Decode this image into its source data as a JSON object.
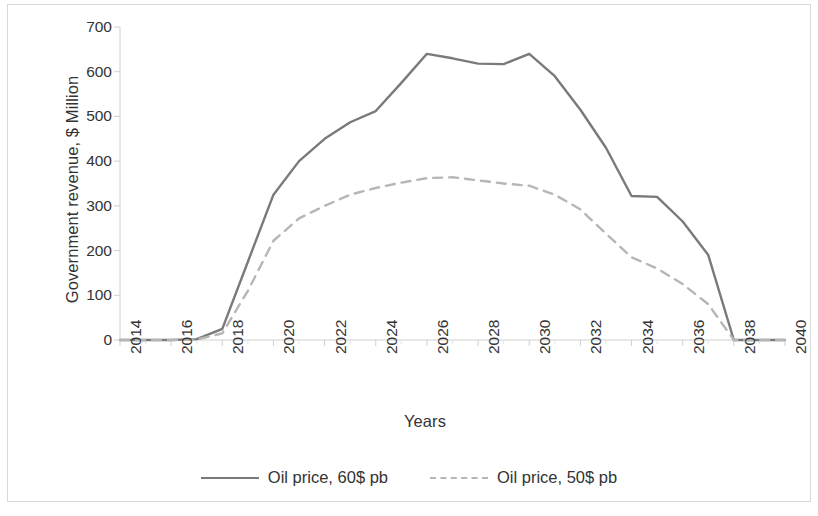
{
  "chart_data": {
    "type": "line",
    "title": "",
    "xlabel": "Years",
    "ylabel": "Government revenue, $ Million",
    "xlim": [
      2014,
      2040
    ],
    "ylim": [
      0,
      700
    ],
    "ytick_step": 100,
    "yticks": [
      0,
      100,
      200,
      300,
      400,
      500,
      600,
      700
    ],
    "xticks": [
      2014,
      2016,
      2018,
      2020,
      2022,
      2024,
      2026,
      2028,
      2030,
      2032,
      2034,
      2036,
      2038,
      2040
    ],
    "xtick_rotation": -90,
    "grid": false,
    "legend_position": "bottom",
    "x": [
      2014,
      2015,
      2016,
      2017,
      2018,
      2019,
      2020,
      2021,
      2022,
      2023,
      2024,
      2025,
      2026,
      2027,
      2028,
      2029,
      2030,
      2031,
      2032,
      2033,
      2034,
      2035,
      2036,
      2037,
      2038,
      2039,
      2040
    ],
    "series": [
      {
        "name": "Oil price, 60$ pb",
        "color": "#7a7a7a",
        "style": "solid",
        "values": [
          0,
          0,
          0,
          2,
          25,
          175,
          325,
          400,
          450,
          487,
          512,
          575,
          640,
          630,
          618,
          617,
          640,
          590,
          515,
          430,
          322,
          320,
          265,
          190,
          0,
          0,
          0
        ]
      },
      {
        "name": "Oil price, 50$ pb",
        "color": "#b6b6b6",
        "style": "dashed",
        "values": [
          0,
          0,
          0,
          1,
          15,
          110,
          222,
          272,
          300,
          325,
          340,
          352,
          362,
          364,
          357,
          350,
          345,
          325,
          292,
          238,
          185,
          160,
          125,
          80,
          0,
          0,
          0
        ]
      }
    ]
  },
  "legend": {
    "items": [
      {
        "label": "Oil price, 60$ pb",
        "style": "solid"
      },
      {
        "label": "Oil price, 50$ pb",
        "style": "dashed"
      }
    ]
  },
  "axes": {
    "y_title": "Government revenue, $ Million",
    "x_title": "Years"
  },
  "colors": {
    "series_60": "#7a7a7a",
    "series_50": "#b6b6b6",
    "axis": "#d0d0d0",
    "text": "#333333",
    "background": "#ffffff"
  }
}
